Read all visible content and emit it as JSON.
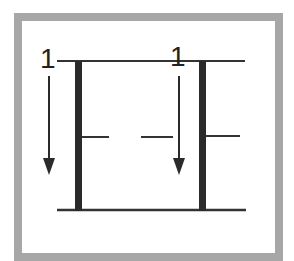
{
  "diagram": {
    "colors": {
      "frame": "#a7a7a7",
      "stroke": "#2a2a2a",
      "background": "#ffffff"
    },
    "left_group": {
      "label": "1",
      "arrow_direction": "down"
    },
    "right_group": {
      "label": "1",
      "arrow_direction": "down"
    }
  }
}
